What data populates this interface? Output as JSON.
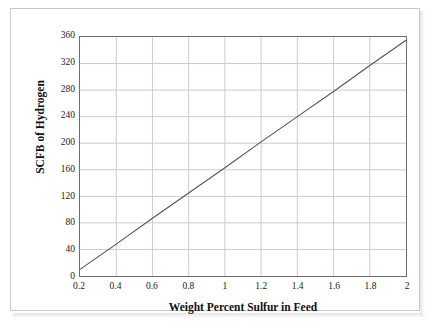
{
  "figure": {
    "background_color": "#ffffff",
    "frame_color": "#c9c9c9"
  },
  "chart_data": {
    "type": "line",
    "title": "",
    "subtitle": "",
    "xlabel": "Weight Percent Sulfur in Feed",
    "ylabel": "SCFB of Hydrogen",
    "xlim": [
      0.2,
      2.0
    ],
    "ylim": [
      0,
      360
    ],
    "xticks": [
      0.2,
      0.4,
      0.6,
      0.8,
      1,
      1.2,
      1.4,
      1.6,
      1.8,
      2
    ],
    "xticklabels": [
      "0.2",
      "0.4",
      "0.6",
      "0.8",
      "1",
      "1.2",
      "1.4",
      "1.6",
      "1.8",
      "2"
    ],
    "yticks": [
      0,
      40,
      80,
      120,
      160,
      200,
      240,
      280,
      320,
      360
    ],
    "yticklabels": [
      "0",
      "40",
      "80",
      "120",
      "160",
      "200",
      "240",
      "280",
      "320",
      "360"
    ],
    "grid": true,
    "grid_axes": "both",
    "grid_color": "#cccccc",
    "legend": false,
    "legend_position": "none",
    "line_color": "#555555",
    "line_width": 1.1,
    "markers": false,
    "series": [
      {
        "name": "SCFB of Hydrogen vs Weight Percent Sulfur",
        "x": [
          0.2,
          0.4,
          0.6,
          0.8,
          1.0,
          1.2,
          1.4,
          1.6,
          1.8,
          2.0
        ],
        "values": [
          10,
          48,
          87,
          125,
          163,
          202,
          240,
          278,
          317,
          355
        ]
      }
    ],
    "slope": 191.7,
    "intercept": -28.3
  }
}
